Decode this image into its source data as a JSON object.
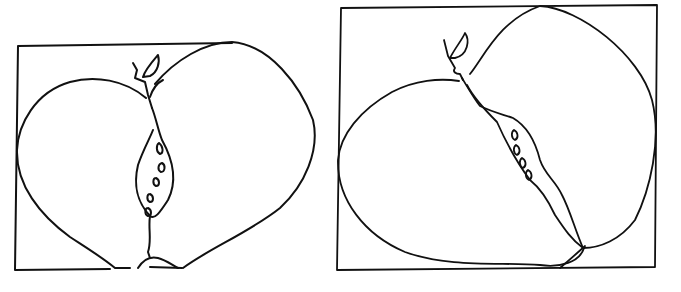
{
  "canvas": {
    "width": 681,
    "height": 292,
    "background": "#ffffff",
    "ink": "#111111"
  },
  "drawings": [
    {
      "name": "apple-left",
      "frame": "M18,46 L232,43 M18,46 L15,270 L110,269 M150,267 L182,268",
      "body_left": "M146,98 C125,80 95,75 70,82 C35,92 18,125 17,150 C16,185 40,215 70,237 C90,250 103,258 115,268 L130,268",
      "body_right": "M155,84 C175,60 205,42 232,42 C270,45 300,85 313,120 C320,150 305,185 280,208 C250,232 210,248 183,268",
      "stem": "M133,63 L137,70 L135,78 L145,82 L148,95 L152,108",
      "leaf": "M143,77 C145,70 152,62 158,55 C160,62 158,72 150,76 Z",
      "leaf2": "M150,97 C153,88 157,83 163,80",
      "core": "M152,108 C156,118 158,130 162,140 C172,158 178,180 168,200 C160,212 155,220 150,216 C140,205 132,190 138,165 C143,150 150,138 153,130",
      "seeds": "M159,143 C163,146 164,153 160,154 C156,152 156,145 159,143 M162,163 C166,165 165,172 161,172 C157,170 158,164 162,163 M156,178 C160,180 160,186 156,186 C152,184 153,178 156,178 M150,194 C154,196 154,202 150,202 C146,200 147,194 150,194 M148,208 C152,210 152,216 148,216 C144,214 145,208 148,208",
      "bottom_stem": "M150,216 C148,228 152,240 148,252 L150,258",
      "blossom": "M138,268 C143,260 150,256 158,258 C166,260 172,265 178,268"
    },
    {
      "name": "pear-right",
      "frame": "M341,8 L657,5 M341,8 L337,270 L655,267 L657,5",
      "body_left": "M459,81 C440,78 415,80 392,92 C360,110 340,135 338,160 C337,200 365,235 405,252 C450,268 500,262 540,265 C560,268 580,262 584,248",
      "body_right": "M470,74 C485,55 500,20 540,6 C580,8 640,55 652,100 C662,140 650,190 635,220 C620,240 600,248 583,248",
      "stem": "M444,40 L448,56 L455,68 C452,72 456,74 460,74 L463,80",
      "leaf": "M450,58 C455,48 462,40 465,33 C470,40 468,55 455,58 Z",
      "core": "M462,78 C468,88 475,100 480,106 C492,112 505,115 513,118 C525,125 535,140 540,160 C545,175 555,180 562,195 C570,210 575,230 583,248",
      "core_inner": "M467,85 C472,95 480,105 497,122 C505,140 515,160 530,180 C540,188 548,200 555,215 C565,230 572,240 583,248",
      "seeds": "M514,130 C518,132 519,138 515,140 C511,138 511,132 514,130 M516,145 C520,147 521,153 517,155 C513,153 513,147 516,145 M522,158 C526,160 527,166 523,168 C519,166 519,160 522,158 M528,170 C532,172 533,178 529,180 C525,178 525,172 528,170",
      "bottom": "M560,268 C567,262 575,255 585,246"
    }
  ]
}
